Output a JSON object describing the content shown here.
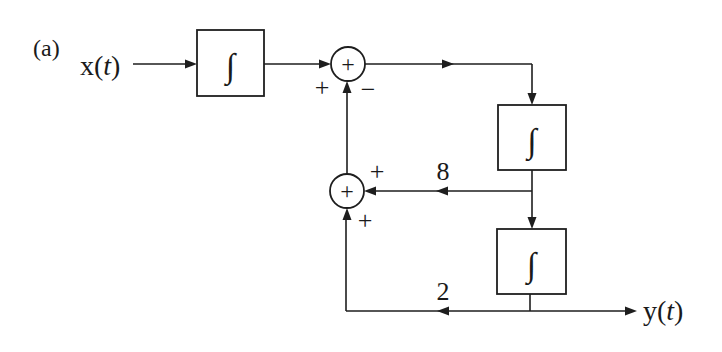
{
  "figure": {
    "label": "(a)",
    "input": {
      "name": "x",
      "arg": "t",
      "open": "(",
      "close": ")"
    },
    "output": {
      "name": "y",
      "arg": "t",
      "open": "(",
      "close": ")"
    },
    "integrator_symbol": "∫",
    "blocks": [
      {
        "id": "integrator-1",
        "symbol": "∫"
      },
      {
        "id": "integrator-2",
        "symbol": "∫"
      },
      {
        "id": "integrator-3",
        "symbol": "∫"
      }
    ],
    "summers": [
      {
        "id": "summer-1",
        "symbol": "+",
        "input_signs": {
          "left": "+",
          "bottom": "−"
        }
      },
      {
        "id": "summer-2",
        "symbol": "+",
        "input_signs": {
          "right": "+",
          "bottom": "+"
        }
      }
    ],
    "gains": {
      "feedback_upper": "8",
      "feedback_lower": "2"
    }
  }
}
